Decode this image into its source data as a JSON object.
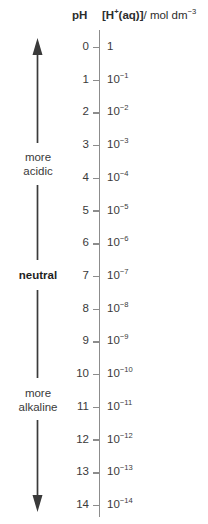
{
  "header": {
    "ph_label": "pH",
    "concentration_label_bold": "[H+(aq)]",
    "concentration_label_rest": "/ mol dm",
    "concentration_exponent": "-3"
  },
  "side_labels": {
    "top": "more\nacidic",
    "top_line1": "more",
    "top_line2": "acidic",
    "middle": "neutral",
    "bottom_line1": "more",
    "bottom_line2": "alkaline"
  },
  "arrows": {
    "up_arrow": "up-arrow",
    "down_arrow": "down-arrow"
  },
  "chart_data": {
    "type": "table",
    "xlabel": "",
    "ylabel": "pH",
    "axis_range": [
      0,
      14
    ],
    "grid": false,
    "legend_position": "none",
    "columns": [
      "pH",
      "[H+(aq)]/ mol dm-3"
    ],
    "categories": [
      "0",
      "1",
      "2",
      "3",
      "4",
      "5",
      "6",
      "7",
      "8",
      "9",
      "10",
      "11",
      "12",
      "13",
      "14"
    ],
    "values": [
      0,
      1,
      2,
      3,
      4,
      5,
      6,
      7,
      8,
      9,
      10,
      11,
      12,
      13,
      14
    ],
    "rows": [
      {
        "ph": "0",
        "mantissa": "1",
        "exponent": ""
      },
      {
        "ph": "1",
        "mantissa": "10",
        "exponent": "-1"
      },
      {
        "ph": "2",
        "mantissa": "10",
        "exponent": "-2"
      },
      {
        "ph": "3",
        "mantissa": "10",
        "exponent": "-3"
      },
      {
        "ph": "4",
        "mantissa": "10",
        "exponent": "-4"
      },
      {
        "ph": "5",
        "mantissa": "10",
        "exponent": "-5"
      },
      {
        "ph": "6",
        "mantissa": "10",
        "exponent": "-6"
      },
      {
        "ph": "7",
        "mantissa": "10",
        "exponent": "-7"
      },
      {
        "ph": "8",
        "mantissa": "10",
        "exponent": "-8"
      },
      {
        "ph": "9",
        "mantissa": "10",
        "exponent": "-9"
      },
      {
        "ph": "10",
        "mantissa": "10",
        "exponent": "-10"
      },
      {
        "ph": "11",
        "mantissa": "10",
        "exponent": "-11"
      },
      {
        "ph": "12",
        "mantissa": "10",
        "exponent": "-12"
      },
      {
        "ph": "13",
        "mantissa": "10",
        "exponent": "-13"
      },
      {
        "ph": "14",
        "mantissa": "10",
        "exponent": "-14"
      }
    ],
    "annotations": [
      "more acidic",
      "neutral",
      "more alkaline"
    ]
  },
  "colors": {
    "background": "#ffffff",
    "text": "#3a3a3a",
    "axis": "#8c8c8c",
    "arrow": "#3a3a3a"
  }
}
